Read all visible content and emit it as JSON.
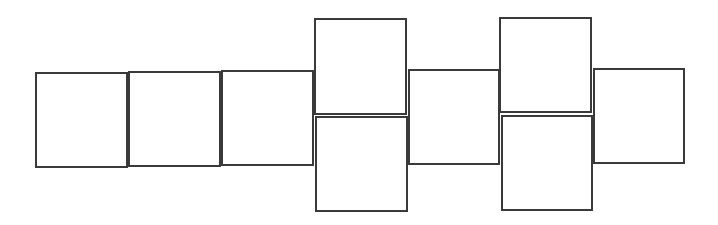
{
  "diagram": {
    "type": "square-net",
    "stroke_color": "#3a3a3a",
    "fill_color": "#ffffff",
    "squares": [
      {
        "id": "square-1",
        "label": ""
      },
      {
        "id": "square-2",
        "label": ""
      },
      {
        "id": "square-3",
        "label": ""
      },
      {
        "id": "square-4-top",
        "label": ""
      },
      {
        "id": "square-5-bottom",
        "label": ""
      },
      {
        "id": "square-6",
        "label": ""
      },
      {
        "id": "square-7-top",
        "label": ""
      },
      {
        "id": "square-8-bottom",
        "label": ""
      },
      {
        "id": "square-9",
        "label": ""
      }
    ]
  }
}
